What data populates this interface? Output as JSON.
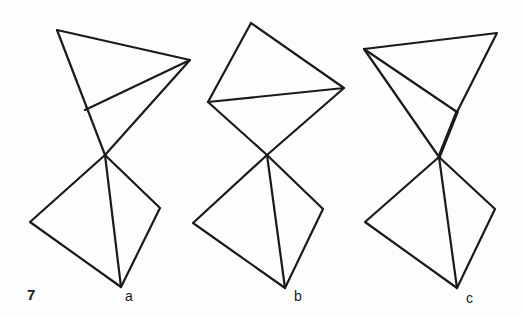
{
  "figure": {
    "number": "7",
    "stroke_color": "#1a1a1a",
    "panels": [
      {
        "label": "a",
        "upper_triangle": {
          "top_left": [
            57,
            30
          ],
          "right": [
            190,
            60
          ],
          "edge_point": [
            85,
            110
          ],
          "apex": [
            105,
            155
          ]
        },
        "lower_triangle": {
          "apex": [
            105,
            155
          ],
          "left": [
            30,
            222
          ],
          "bottom": [
            121,
            287
          ],
          "right": [
            160,
            208
          ]
        }
      },
      {
        "label": "b",
        "upper_triangle": {
          "top": [
            251,
            23
          ],
          "left": [
            208,
            102
          ],
          "right": [
            344,
            88
          ],
          "apex": [
            267,
            155
          ]
        },
        "lower_triangle": {
          "apex": [
            267,
            155
          ],
          "left": [
            193,
            223
          ],
          "bottom": [
            285,
            288
          ],
          "right": [
            323,
            209
          ]
        }
      },
      {
        "label": "c",
        "upper_triangle": {
          "top_left": [
            364,
            49
          ],
          "top_right": [
            497,
            33
          ],
          "edge_point": [
            457,
            112
          ],
          "apex": [
            439,
            157
          ]
        },
        "lower_triangle": {
          "apex": [
            439,
            157
          ],
          "left": [
            365,
            222
          ],
          "bottom": [
            457,
            288
          ],
          "right": [
            495,
            209
          ]
        }
      }
    ]
  }
}
